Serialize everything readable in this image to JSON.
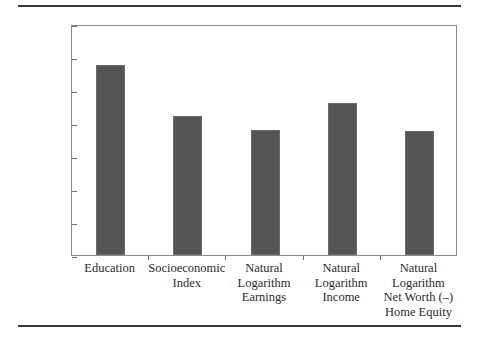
{
  "chart_data": {
    "type": "bar",
    "title": "",
    "xlabel": "",
    "ylabel": "Sibling Intra-Class Correlation",
    "ylim": [
      0.0,
      0.7
    ],
    "ytick_labels": [
      "0.7",
      "0.6",
      "0.5",
      "0.4",
      "0.3",
      "0.2",
      "0.1",
      "0.0"
    ],
    "ytick_values": [
      0.7,
      0.6,
      0.5,
      0.4,
      0.3,
      0.2,
      0.1,
      0.0
    ],
    "grid": false,
    "legend": "none",
    "bar_color": "#545454",
    "categories": [
      "Education",
      "Socioeconomic Index",
      "Natural Logarithm Earnings",
      "Natural Logarithm Income",
      "Natural Logarithm Net Worth (–) Home Equity"
    ],
    "category_lines": [
      [
        "Education"
      ],
      [
        "Socioeconomic",
        "Index"
      ],
      [
        "Natural",
        "Logarithm",
        "Earnings"
      ],
      [
        "Natural",
        "Logarithm",
        "Income"
      ],
      [
        "Natural",
        "Logarithm",
        "Net Worth (–)",
        "Home Equity"
      ]
    ],
    "values": [
      0.575,
      0.42,
      0.38,
      0.46,
      0.375
    ]
  }
}
